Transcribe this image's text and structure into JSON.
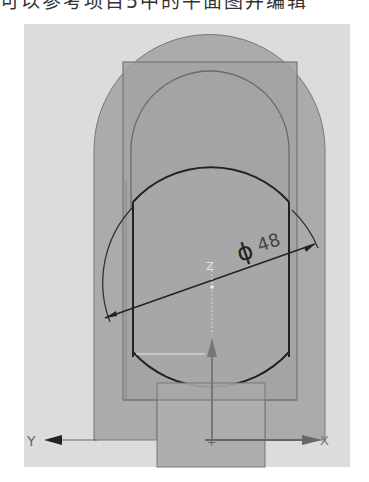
{
  "header": {
    "text": "可以参考项目5中的平面图并编辑"
  },
  "sketch": {
    "dimension": {
      "symbol": "ϕ",
      "value": "48"
    },
    "axes": {
      "x_label": "X",
      "y_label": "Y",
      "z_label": "Z"
    },
    "colors": {
      "background_panel": "#dcdcdc",
      "outer_shape": "#a9a9a9",
      "rectangle": "#9f9f9f",
      "inner_arch": "#a2a2a2",
      "bottom_block": "#a6a6a6",
      "lines": "#555555",
      "curve": "#222222",
      "axis": "#666666"
    }
  }
}
